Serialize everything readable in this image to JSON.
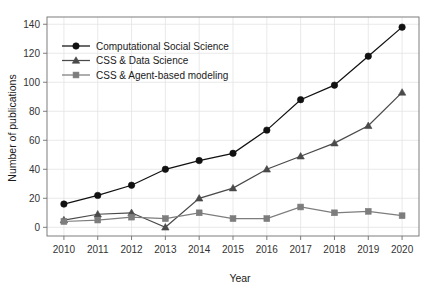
{
  "chart_data": {
    "type": "line",
    "title": "",
    "xlabel": "Year",
    "ylabel": "Number of publications",
    "categories": [
      2010,
      2011,
      2012,
      2013,
      2014,
      2015,
      2016,
      2017,
      2018,
      2019,
      2020
    ],
    "x": [
      2010,
      2011,
      2012,
      2013,
      2014,
      2015,
      2016,
      2017,
      2018,
      2019,
      2020
    ],
    "xlim": [
      2009.5,
      2020.5
    ],
    "ylim": [
      -6,
      145
    ],
    "yticks": [
      0,
      20,
      40,
      60,
      80,
      100,
      120,
      140
    ],
    "xticks": [
      2010,
      2011,
      2012,
      2013,
      2014,
      2015,
      2016,
      2017,
      2018,
      2019,
      2020
    ],
    "grid": true,
    "legend_position": "upper-left",
    "series": [
      {
        "name": "Computational Social Science",
        "marker": "circle",
        "color": "#111111",
        "values": [
          16,
          22,
          29,
          40,
          46,
          51,
          67,
          88,
          98,
          118,
          138
        ]
      },
      {
        "name": "CSS & Data Science",
        "marker": "triangle",
        "color": "#4a4a4a",
        "values": [
          5,
          9,
          10,
          0,
          20,
          27,
          40,
          49,
          58,
          70,
          93
        ]
      },
      {
        "name": "CSS & Agent-based modeling",
        "marker": "square",
        "color": "#7d7d7d",
        "values": [
          4,
          5,
          7,
          6,
          10,
          6,
          6,
          14,
          10,
          11,
          8
        ]
      }
    ]
  },
  "axis": {
    "y_tick_labels": [
      "0",
      "20",
      "40",
      "60",
      "80",
      "100",
      "120",
      "140"
    ],
    "x_tick_labels": [
      "2010",
      "2011",
      "2012",
      "2013",
      "2014",
      "2015",
      "2016",
      "2017",
      "2018",
      "2019",
      "2020"
    ],
    "x_title": "Year",
    "y_title": "Number of publications"
  },
  "legend": {
    "entries": [
      {
        "label": "Computational Social Science",
        "marker": "circle-marker-icon",
        "color": "#111111"
      },
      {
        "label": "CSS & Data Science",
        "marker": "triangle-marker-icon",
        "color": "#4a4a4a"
      },
      {
        "label": "CSS & Agent-based modeling",
        "marker": "square-marker-icon",
        "color": "#7d7d7d"
      }
    ]
  },
  "colors": {
    "series_1": "#111111",
    "series_2": "#4a4a4a",
    "series_3": "#7d7d7d",
    "grid": "#e3e3e3",
    "border": "#6f6f6f",
    "background": "#ffffff"
  }
}
